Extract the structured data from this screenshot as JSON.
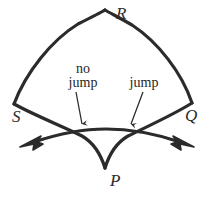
{
  "figure": {
    "name": "curved-quadrilateral-jump-diagram",
    "background_color": "#ffffff",
    "stroke_color": "#2b2b2b",
    "text_color": "#1f1f1f"
  },
  "vertices": [
    {
      "id": "R",
      "label": "R",
      "position": "top-apex",
      "x": 105,
      "y": 10
    },
    {
      "id": "S",
      "label": "S",
      "position": "left",
      "x": 14,
      "y": 104
    },
    {
      "id": "Q",
      "label": "Q",
      "position": "right",
      "x": 192,
      "y": 103
    },
    {
      "id": "P",
      "label": "P",
      "position": "bottom-cusp",
      "x": 105,
      "y": 168
    }
  ],
  "annotations": [
    {
      "id": "no-jump",
      "line1": "no",
      "line2": "jump",
      "points_to": "left-crossing-point",
      "arrow_from": {
        "x": 76,
        "y": 92
      },
      "arrow_to": {
        "x": 82,
        "y": 126
      }
    },
    {
      "id": "jump",
      "line1": "jump",
      "line2": "",
      "points_to": "right-crossing-point",
      "arrow_from": {
        "x": 143,
        "y": 92
      },
      "arrow_to": {
        "x": 131,
        "y": 126
      }
    }
  ],
  "trajectory": {
    "name": "double-headed-arrow-path",
    "left_arrowhead": "arrow-left",
    "right_arrowhead": "arrow-right",
    "crosses": [
      "left-crossing-point",
      "right-crossing-point"
    ]
  }
}
